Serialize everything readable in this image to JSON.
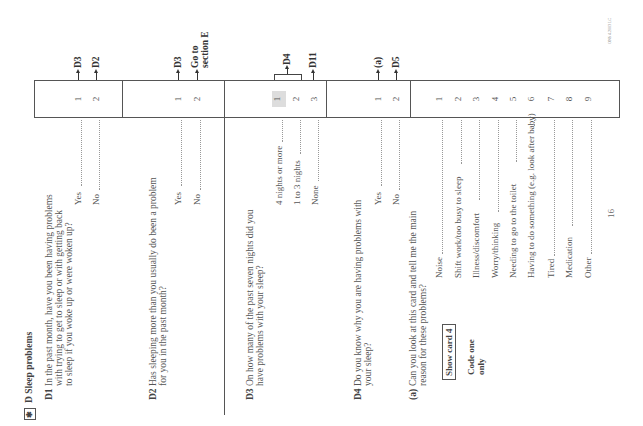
{
  "section": {
    "marker_icon": "asterisk-box",
    "title": "D Sleep problems"
  },
  "questions": [
    {
      "id": "D1",
      "lines": [
        "In the past month, have you been having problems",
        "with trying to get to sleep or with getting back",
        "to sleep if you woke up or were woken up?"
      ],
      "options": [
        {
          "label": "Yes",
          "code": "1",
          "route": "D3"
        },
        {
          "label": "No",
          "code": "2",
          "route": "D2"
        }
      ]
    },
    {
      "id": "D2",
      "lines": [
        "Has sleeping more than you usually do been a problem",
        "for you in the past month?"
      ],
      "options": [
        {
          "label": "Yes",
          "code": "1",
          "route": "D3"
        },
        {
          "label": "No",
          "code": "2",
          "route_lines": [
            "Go to",
            "section E"
          ]
        }
      ]
    },
    {
      "id": "D3",
      "lines": [
        "On how many of the past seven nights did you",
        "have problems with your sleep?"
      ],
      "options": [
        {
          "label": "4 nights or more",
          "code": "1",
          "highlighted": true
        },
        {
          "label": "1 to 3 nights",
          "code": "2"
        },
        {
          "label": "None",
          "code": "3",
          "route": "D11"
        }
      ],
      "bracket_route": "D4"
    },
    {
      "id": "D4",
      "lines": [
        "Do you know why you are having problems with",
        "your sleep?"
      ],
      "options": [
        {
          "label": "Yes",
          "code": "1",
          "route": "(a)"
        },
        {
          "label": "No",
          "code": "2",
          "route": "D5"
        }
      ]
    },
    {
      "id": "(a)",
      "lines": [
        "Can you look at this card and tell me the main",
        "reason for these problems?"
      ],
      "bold_word": "main",
      "show_card": "Show card 4",
      "instruction_lines": [
        "Code one",
        "only"
      ],
      "options": [
        {
          "label": "Noise",
          "code": "1"
        },
        {
          "label": "Shift work/too busy to sleep",
          "code": "2"
        },
        {
          "label": "Illness/discomfort",
          "code": "3"
        },
        {
          "label": "Worry/thinking",
          "code": "4"
        },
        {
          "label": "Needing to go to the toilet",
          "code": "5"
        },
        {
          "label": "Having to do something (e.g. look after baby)",
          "code": "6"
        },
        {
          "label": "Tired",
          "code": "7"
        },
        {
          "label": "Medication",
          "code": "8"
        },
        {
          "label": "Other",
          "code": "9"
        }
      ]
    }
  ],
  "page_number": "16",
  "corner_code": "ONS 4.2003 LC"
}
